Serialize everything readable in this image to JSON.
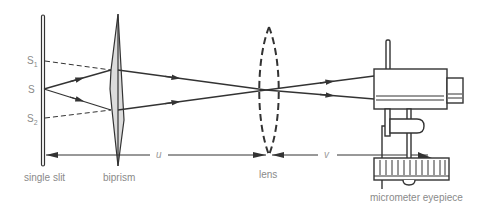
{
  "diagram": {
    "components": {
      "slit": {
        "label": "single slit"
      },
      "biprism": {
        "label": "biprism"
      },
      "lens": {
        "label": "lens"
      },
      "eyepiece": {
        "label": "micrometer eyepiece"
      }
    },
    "sources": {
      "s1": "S",
      "s1_sub": "1",
      "s": "S",
      "s2": "S",
      "s2_sub": "2"
    },
    "distances": {
      "u": "u",
      "v": "v"
    },
    "colors": {
      "ink": "#333333",
      "label": "#8a8a8a",
      "prism_fill": "#dcdcdc"
    }
  }
}
